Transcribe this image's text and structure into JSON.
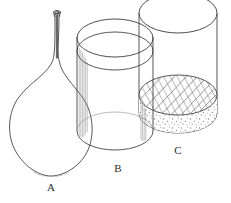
{
  "figure": {
    "background_color": "#ffffff",
    "stroke_color": "#3a3a3a",
    "hatch_color": "#6e6e6e",
    "stipple_color": "#8a8a8a",
    "label_color": "#2b2b2b",
    "width": 231,
    "height": 203
  },
  "objects": [
    {
      "id": "A",
      "label": "A",
      "kind": "round-bottom-flask",
      "description": "Pear shaped flask with long narrow neck and flared lip",
      "label_x": 51,
      "label_y": 191,
      "neck_top_y": 11,
      "bulb_bottom_y": 176,
      "bulb_left_x": 9,
      "bulb_right_x": 91,
      "contents": "empty"
    },
    {
      "id": "B",
      "label": "B",
      "kind": "cylinder-beaker",
      "description": "Open cylinder with double rim ellipse, vertical shading lines on left wall",
      "label_x": 118,
      "label_y": 172,
      "top_y": 37,
      "rim_inner_y": 52,
      "bottom_y": 150,
      "left_x": 77,
      "right_x": 153,
      "contents": "empty"
    },
    {
      "id": "C",
      "label": "C",
      "kind": "cylinder-beaker",
      "description": "Open cylinder partly filled; hatched liquid surface ellipse over stippled sediment layer",
      "label_x": 178,
      "label_y": 154,
      "top_y": 13,
      "bottom_y": 133,
      "left_x": 139,
      "right_x": 217,
      "contents": "hatched-liquid-over-stippled-sediment",
      "liquid_surface_y": 95,
      "liquid_level_y": 112
    }
  ],
  "labels": [
    {
      "text": "A",
      "x": 51,
      "y": 191
    },
    {
      "text": "B",
      "x": 118,
      "y": 172
    },
    {
      "text": "C",
      "x": 178,
      "y": 154
    }
  ]
}
